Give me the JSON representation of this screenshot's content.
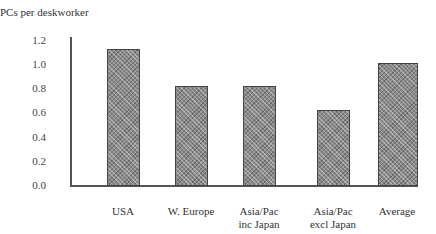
{
  "chart_data": {
    "type": "bar",
    "title": "",
    "xlabel": "",
    "ylabel": "PCs per deskworker",
    "ylim": [
      0.0,
      1.2
    ],
    "yticks": [
      "0.0",
      "0.2",
      "0.4",
      "0.6",
      "0.8",
      "1.0",
      "1.2"
    ],
    "grid": false,
    "legend": null,
    "categories": [
      "USA",
      "W. Europe",
      "Asia/Pac inc Japan",
      "Asia/Pac excl Japan",
      "Average"
    ],
    "category_lines": [
      [
        "USA"
      ],
      [
        "W. Europe"
      ],
      [
        "Asia/Pac",
        "inc Japan"
      ],
      [
        "Asia/Pac",
        "excl Japan"
      ],
      [
        "Average"
      ]
    ],
    "values": [
      1.13,
      0.83,
      0.83,
      0.63,
      1.02
    ],
    "bar_color": "#8a8a8a"
  },
  "labels": {
    "ylabel": "PCs per deskworker",
    "ticks": {
      "t0": "0.0",
      "t1": "0.2",
      "t2": "0.4",
      "t3": "0.6",
      "t4": "0.8",
      "t5": "1.0",
      "t6": "1.2"
    },
    "cats": {
      "c0a": "USA",
      "c0b": "",
      "c1a": "W. Europe",
      "c1b": "",
      "c2a": "Asia/Pac",
      "c2b": "inc Japan",
      "c3a": "Asia/Pac",
      "c3b": "excl Japan",
      "c4a": "Average",
      "c4b": ""
    }
  }
}
